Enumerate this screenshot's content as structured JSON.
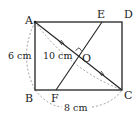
{
  "figure": {
    "points": {
      "A": "A",
      "B": "B",
      "C": "C",
      "D": "D",
      "E": "E",
      "F": "F",
      "O": "O"
    },
    "measurements": {
      "AB": "6 cm",
      "AC": "10 cm",
      "BC": "8 cm"
    },
    "relations": {
      "EF_perpendicular_AC_at_O": true,
      "AO_equals_OC": true
    },
    "colors": {
      "line": "#222222",
      "dashed": "#888888"
    }
  }
}
